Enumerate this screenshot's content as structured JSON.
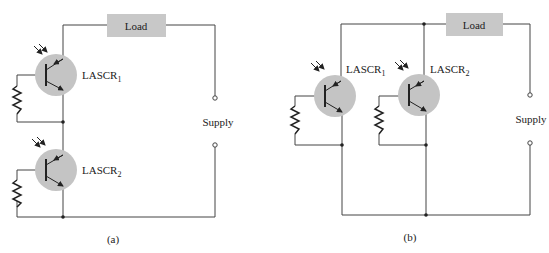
{
  "diagram_a": {
    "caption": "(a)",
    "load_label": "Load",
    "supply_label": "Supply",
    "device1": {
      "name": "LASCR",
      "sub": "1"
    },
    "device2": {
      "name": "LASCR",
      "sub": "2"
    }
  },
  "diagram_b": {
    "caption": "(b)",
    "load_label": "Load",
    "supply_label": "Supply",
    "device1": {
      "name": "LASCR",
      "sub": "1"
    },
    "device2": {
      "name": "LASCR",
      "sub": "2"
    }
  },
  "colors": {
    "wire": "#444444",
    "load_fill": "#c8c8c8",
    "device_fill": "#c4c4c4"
  }
}
